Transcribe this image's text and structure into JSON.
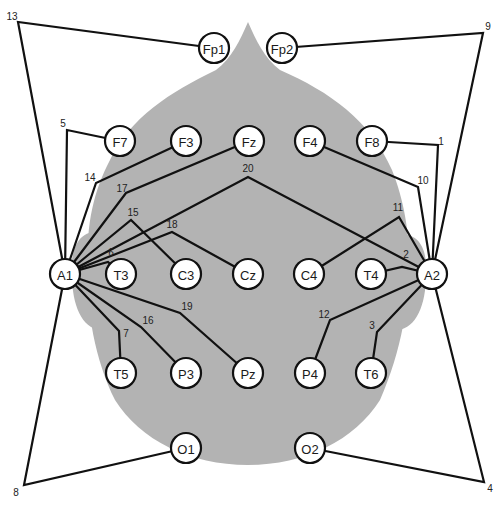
{
  "colors": {
    "head_fill": "#b3b3b3",
    "line": "#111111",
    "electrode_fill": "#ffffff",
    "background": "#ffffff"
  },
  "electrodes": [
    {
      "id": "Fp1",
      "label": "Fp1",
      "x": 214,
      "y": 48
    },
    {
      "id": "Fp2",
      "label": "Fp2",
      "x": 282,
      "y": 48
    },
    {
      "id": "F7",
      "label": "F7",
      "x": 120,
      "y": 141
    },
    {
      "id": "F3",
      "label": "F3",
      "x": 186,
      "y": 141
    },
    {
      "id": "Fz",
      "label": "Fz",
      "x": 249,
      "y": 141
    },
    {
      "id": "F4",
      "label": "F4",
      "x": 310,
      "y": 141
    },
    {
      "id": "F8",
      "label": "F8",
      "x": 372,
      "y": 141
    },
    {
      "id": "A1",
      "label": "A1",
      "x": 65,
      "y": 274
    },
    {
      "id": "T3",
      "label": "T3",
      "x": 121,
      "y": 274
    },
    {
      "id": "C3",
      "label": "C3",
      "x": 186,
      "y": 274
    },
    {
      "id": "Cz",
      "label": "Cz",
      "x": 248,
      "y": 274
    },
    {
      "id": "C4",
      "label": "C4",
      "x": 309,
      "y": 274
    },
    {
      "id": "T4",
      "label": "T4",
      "x": 371,
      "y": 274
    },
    {
      "id": "A2",
      "label": "A2",
      "x": 432,
      "y": 274
    },
    {
      "id": "T5",
      "label": "T5",
      "x": 121,
      "y": 373
    },
    {
      "id": "P3",
      "label": "P3",
      "x": 186,
      "y": 373
    },
    {
      "id": "Pz",
      "label": "Pz",
      "x": 248,
      "y": 373
    },
    {
      "id": "P4",
      "label": "P4",
      "x": 310,
      "y": 373
    },
    {
      "id": "T6",
      "label": "T6",
      "x": 371,
      "y": 373
    },
    {
      "id": "O1",
      "label": "O1",
      "x": 186,
      "y": 448
    },
    {
      "id": "O2",
      "label": "O2",
      "x": 310,
      "y": 448
    }
  ],
  "derivations": [
    {
      "number": "1",
      "from": "F8",
      "to": "A2",
      "bend": [
        438,
        145
      ],
      "label_pos": [
        441,
        141
      ]
    },
    {
      "number": "2",
      "from": "T4",
      "to": "A2",
      "bend": [
        402,
        267
      ],
      "label_pos": [
        406,
        254
      ]
    },
    {
      "number": "3",
      "from": "A2",
      "to": "T6",
      "bend": [
        377,
        332
      ],
      "label_pos": [
        372,
        325
      ]
    },
    {
      "number": "4",
      "from": "O2",
      "to": "A2",
      "bend": [
        484,
        482
      ],
      "label_pos": [
        490,
        488
      ]
    },
    {
      "number": "5",
      "from": "F7",
      "to": "A1",
      "bend": [
        67,
        130
      ],
      "label_pos": [
        63,
        123
      ]
    },
    {
      "number": "6",
      "from": "A1",
      "to": "T3",
      "bend": [
        108,
        262
      ],
      "label_pos": [
        111,
        252
      ]
    },
    {
      "number": "7",
      "from": "A1",
      "to": "T5",
      "bend": [
        119,
        331
      ],
      "label_pos": [
        126,
        333
      ]
    },
    {
      "number": "8",
      "from": "O1",
      "to": "A1",
      "bend": [
        24,
        485
      ],
      "label_pos": [
        16,
        492
      ]
    },
    {
      "number": "9",
      "from": "Fp2",
      "to": "A2",
      "bend": [
        483,
        33
      ],
      "label_pos": [
        488,
        26
      ]
    },
    {
      "number": "10",
      "from": "F4",
      "to": "A2",
      "bend": [
        418,
        187
      ],
      "label_pos": [
        423,
        180
      ]
    },
    {
      "number": "11",
      "from": "C4",
      "to": "A2",
      "bend": [
        399,
        217
      ],
      "label_pos": [
        398,
        207
      ]
    },
    {
      "number": "12",
      "from": "A2",
      "to": "P4",
      "bend": [
        330,
        320
      ],
      "label_pos": [
        324,
        314
      ]
    },
    {
      "number": "13",
      "from": "Fp1",
      "to": "A1",
      "bend": [
        18,
        22
      ],
      "label_pos": [
        12,
        16
      ]
    },
    {
      "number": "14",
      "from": "F3",
      "to": "A1",
      "bend": [
        96,
        183
      ],
      "label_pos": [
        90,
        177
      ]
    },
    {
      "number": "15",
      "from": "A1",
      "to": "C3",
      "bend": [
        131,
        220
      ],
      "label_pos": [
        133,
        212
      ]
    },
    {
      "number": "16",
      "from": "A1",
      "to": "P3",
      "bend": [
        141,
        327
      ],
      "label_pos": [
        148,
        320
      ]
    },
    {
      "number": "17",
      "from": "Fz",
      "to": "A1",
      "bend": [
        126,
        193
      ],
      "label_pos": [
        122,
        188
      ]
    },
    {
      "number": "18",
      "from": "A1",
      "to": "Cz",
      "bend": [
        172,
        232
      ],
      "label_pos": [
        172,
        224
      ]
    },
    {
      "number": "19",
      "from": "A1",
      "to": "Pz",
      "bend": [
        180,
        313
      ],
      "label_pos": [
        187,
        306
      ]
    },
    {
      "number": "20",
      "from": "A1",
      "to": "A2",
      "bend": [
        248,
        177
      ],
      "label_pos": [
        248,
        168
      ]
    }
  ]
}
